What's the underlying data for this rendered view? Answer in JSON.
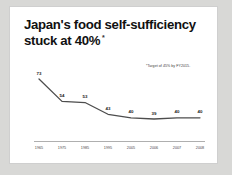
{
  "slide": {
    "title_line_1": "Japan's food self-sufficiency",
    "title_line_2": "stuck at 40%",
    "title_asterisk": "*",
    "footnote": "*Target of 45% by FY2015."
  },
  "chart_data": {
    "type": "line",
    "title": "Japan's food self-sufficiency stuck at 40%",
    "xlabel": "",
    "ylabel": "",
    "categories": [
      "1965",
      "1975",
      "1985",
      "1995",
      "2005",
      "2006",
      "2007",
      "2008"
    ],
    "values": [
      73,
      54,
      53,
      43,
      40,
      39,
      40,
      40
    ],
    "data_labels": [
      "73",
      "54",
      "53",
      "43",
      "40",
      "39",
      "40",
      "40"
    ],
    "ylim": [
      0,
      80
    ],
    "grid": false,
    "legend": false,
    "annotations": [
      "*Target of 45% by FY2015."
    ],
    "series_color": "#4d4d4d",
    "axis_color": "#9a9a9a"
  }
}
